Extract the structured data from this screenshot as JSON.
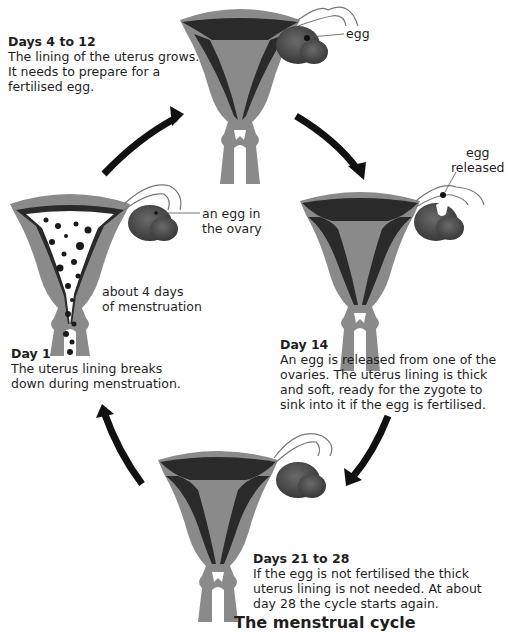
{
  "title": "The menstrual cycle",
  "stages": [
    {
      "id": "days-4-12",
      "heading": "Days 4 to 12",
      "lines": [
        "The lining of the uterus grows.",
        "It needs to prepare for a",
        "fertilised egg."
      ],
      "labels": [
        "egg"
      ]
    },
    {
      "id": "day-14",
      "heading": "Day 14",
      "lines": [
        "An egg is released from one of the",
        "ovaries. The uterus lining is thick",
        "and soft, ready for the zygote to",
        "sink into it if the egg is fertilised."
      ],
      "labels": [
        "egg",
        "released"
      ]
    },
    {
      "id": "days-21-28",
      "heading": "Days 21 to 28",
      "lines": [
        "If the egg is not fertilised the thick",
        "uterus lining is not needed. At about",
        "day 28 the cycle starts again."
      ],
      "labels": []
    },
    {
      "id": "day-1",
      "heading": "Day 1",
      "lines": [
        "The uterus lining breaks",
        "down during menstruation."
      ],
      "labels": [
        "an egg in",
        "the ovary",
        "about 4 days",
        "of menstruation"
      ]
    }
  ],
  "colors": {
    "uterus_wall": "#8a8a8a",
    "lining": "#2a2a2a",
    "ovary": "#4a4a4a",
    "arrow": "#111111",
    "text": "#1e1e1e"
  }
}
